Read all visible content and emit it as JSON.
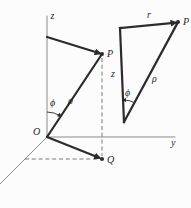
{
  "diagram": {
    "left": {
      "z_axis_label": "z",
      "y_axis_label": "y",
      "origin_label": "O",
      "point_p_label": "P",
      "point_q_label": "Q",
      "angle_label": "ϕ",
      "rho_label": "ρ"
    },
    "right": {
      "r_label": "r",
      "point_p_label": "P",
      "z_label": "z",
      "angle_label": "ϕ",
      "rho_label": "ρ"
    }
  },
  "colors": {
    "background": "#fcfcfc",
    "line": "#2b2b2b",
    "axis": "#8a8a8a",
    "dash": "#6b6b6b",
    "text": "#1f1f1f"
  }
}
